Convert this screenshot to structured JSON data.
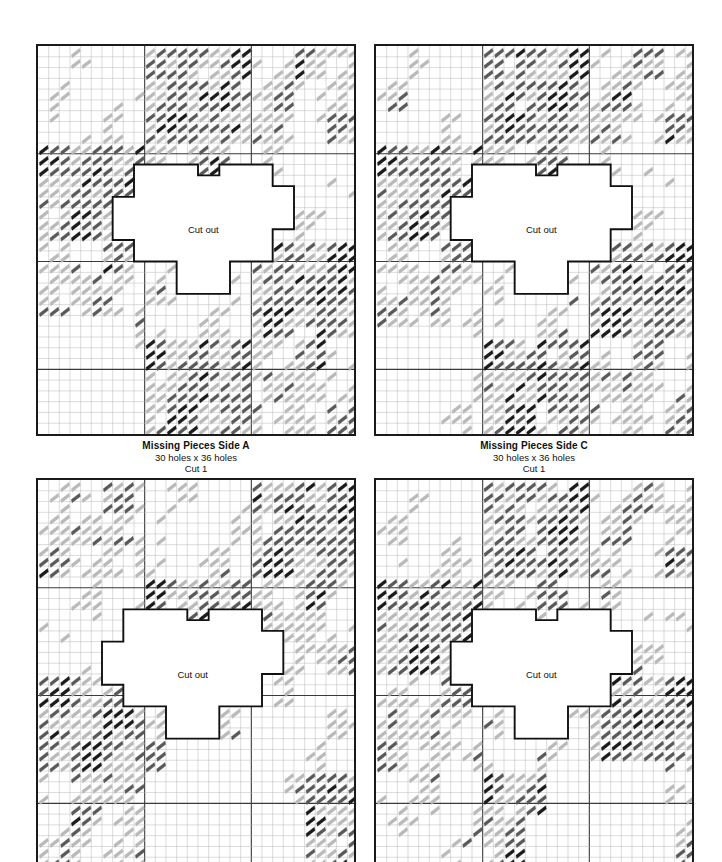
{
  "document": {
    "kind": "needlepoint-stitch-pattern-chart",
    "background_color": "#ffffff"
  },
  "style": {
    "stitch_dark": "#1a1a1a",
    "stitch_mid": "#595959",
    "stitch_light": "#b9b9b9",
    "grid_minor": "#b0b0b0",
    "grid_major": "#3a3a3a",
    "border": "#1a1a1a",
    "cutout_line": "#111111",
    "paper": "#ffffff"
  },
  "grid": {
    "cols": 30,
    "rows": 36,
    "major_every": 10,
    "cell_px": 10.6667
  },
  "panels": [
    {
      "id": "side-a",
      "position": "top-left",
      "caption": {
        "title": "Missing Pieces Side A",
        "size": "30 holes x 36 holes",
        "cut": "Cut 1"
      },
      "cutout_label": "Cut out",
      "cutout_origin": {
        "col": 6,
        "row": 11
      },
      "seed": 11,
      "show_caption": true
    },
    {
      "id": "side-c",
      "position": "top-right",
      "caption": {
        "title": "Missing Pieces Side C",
        "size": "30 holes x 36 holes",
        "cut": "Cut 1"
      },
      "cutout_label": "Cut out",
      "cutout_origin": {
        "col": 6,
        "row": 11
      },
      "seed": 23,
      "show_caption": true
    },
    {
      "id": "side-b",
      "position": "bottom-left",
      "caption": {
        "title": "",
        "size": "",
        "cut": ""
      },
      "cutout_label": "Cut out",
      "cutout_origin": {
        "col": 5,
        "row": 12
      },
      "seed": 37,
      "show_caption": false
    },
    {
      "id": "side-d",
      "position": "bottom-right",
      "caption": {
        "title": "",
        "size": "",
        "cut": ""
      },
      "cutout_label": "Cut out",
      "cutout_origin": {
        "col": 6,
        "row": 12
      },
      "seed": 53,
      "show_caption": false
    }
  ],
  "cutout_shape": {
    "description": "stepped cross / plus shaped cut-out outline following grid cells",
    "cells_wide": 18,
    "cells_tall": 12,
    "path_cells": [
      [
        3,
        0
      ],
      [
        9,
        0
      ],
      [
        9,
        1
      ],
      [
        11,
        1
      ],
      [
        11,
        0
      ],
      [
        16,
        0
      ],
      [
        16,
        2
      ],
      [
        18,
        2
      ],
      [
        18,
        6
      ],
      [
        16,
        6
      ],
      [
        16,
        9
      ],
      [
        12,
        9
      ],
      [
        12,
        12
      ],
      [
        7,
        12
      ],
      [
        7,
        9
      ],
      [
        3,
        9
      ],
      [
        3,
        7
      ],
      [
        1,
        7
      ],
      [
        1,
        3
      ],
      [
        3,
        3
      ]
    ]
  },
  "layout": {
    "panel_width_px": 320,
    "panel_height_px": 388,
    "top_y": 44,
    "bottom_y": 478,
    "left_x": 36,
    "right_x": 374
  }
}
